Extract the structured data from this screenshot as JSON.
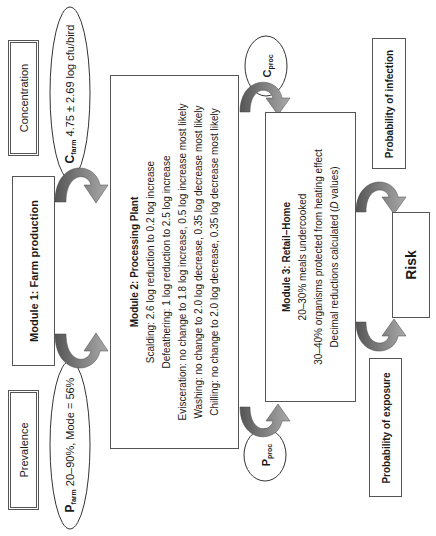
{
  "diagram": {
    "orientation": "rotated-90-ccw",
    "concentration": {
      "label": "Concentration"
    },
    "c_farm": {
      "symbol": "C",
      "subscript": "farm",
      "value": "4.75 ± 2.69 log cfu/bird"
    },
    "module1": {
      "title": "Module 1: Farm production"
    },
    "p_farm": {
      "symbol": "P",
      "subscript": "farm",
      "value": "20–90%,  Mode = 56%"
    },
    "prevalence": {
      "label": "Prevalence"
    },
    "module2": {
      "title": "Module 2: Processing  Plant",
      "lines": [
        "Scalding: 2.6 log reduction to 0.2 log increase",
        "Defeathering: 1 log reduction to 2.5 log increase",
        "Evisceration: no change to 1.8 log increase, 0.5 log increase most likely",
        "Washing: no change to 2.0 log decrease, 0.35 log decrease most likely",
        "Chilling: no change to 2.0 log decrease, 0.35 log decrease most likely"
      ]
    },
    "c_proc": {
      "symbol": "C",
      "subscript": "proc"
    },
    "p_proc": {
      "symbol": "P",
      "subscript": "proc"
    },
    "module3": {
      "title": "Module 3: Retail–Home",
      "lines": [
        "20–30% meals undercooked",
        "30–40% organisms protected from heating effect",
        "Decimal reductions calculated (",
        "D",
        " values)"
      ]
    },
    "prob_infection": {
      "label": "Probability of infection"
    },
    "risk": {
      "label": "Risk"
    },
    "prob_exposure": {
      "label": "Probability of exposure"
    },
    "colors": {
      "arrow_dark": "#5a5a5a",
      "arrow_light": "#9a9a9a",
      "border": "#555555"
    }
  }
}
